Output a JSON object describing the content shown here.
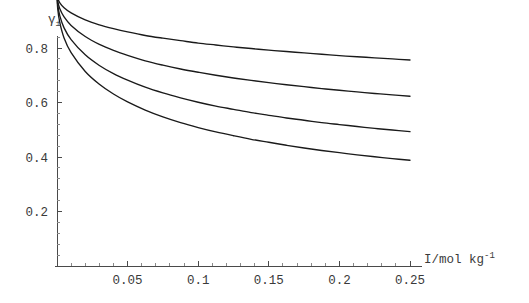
{
  "chart_data": {
    "type": "line",
    "title": "",
    "subtitle": "",
    "xlabel": "I/mol kg⁻¹",
    "ylabel": "γ±",
    "xlabel_parts": {
      "base": "I/mol kg",
      "exponent": "-1"
    },
    "ylabel_parts": {
      "base": "γ",
      "subscript": "±"
    },
    "xlim": [
      0,
      0.26
    ],
    "ylim": [
      0,
      1.06
    ],
    "grid": false,
    "legend": "none",
    "xticks": [
      0.05,
      0.1,
      0.15,
      0.2,
      0.25
    ],
    "xtick_labels": [
      "0.05",
      "0.1",
      "0.15",
      "0.2",
      "0.25"
    ],
    "yticks": [
      0.2,
      0.4,
      0.6,
      0.8,
      1
    ],
    "ytick_labels": [
      "0.2",
      "0.4",
      "0.6",
      "0.8",
      "1"
    ],
    "x_minor_step": 0.01,
    "y_minor_step": 0.04,
    "x": [
      0.0005,
      0.002,
      0.005,
      0.01,
      0.02,
      0.03,
      0.04,
      0.05,
      0.0625,
      0.075,
      0.0875,
      0.1,
      0.1125,
      0.125,
      0.1375,
      0.15,
      0.1625,
      0.175,
      0.1875,
      0.2,
      0.2125,
      0.225,
      0.2375,
      0.25
    ],
    "series": [
      {
        "name": "curve-1",
        "values": [
          0.983,
          0.966,
          0.948,
          0.929,
          0.903,
          0.885,
          0.871,
          0.859,
          0.846,
          0.836,
          0.827,
          0.818,
          0.811,
          0.804,
          0.798,
          0.792,
          0.787,
          0.782,
          0.777,
          0.772,
          0.768,
          0.764,
          0.76,
          0.756
        ]
      },
      {
        "name": "curve-2",
        "values": [
          0.972,
          0.944,
          0.914,
          0.883,
          0.842,
          0.813,
          0.791,
          0.773,
          0.753,
          0.737,
          0.723,
          0.711,
          0.7,
          0.69,
          0.681,
          0.673,
          0.665,
          0.658,
          0.651,
          0.645,
          0.639,
          0.633,
          0.628,
          0.623
        ]
      },
      {
        "name": "curve-3",
        "values": [
          0.958,
          0.918,
          0.874,
          0.831,
          0.775,
          0.736,
          0.706,
          0.682,
          0.656,
          0.635,
          0.617,
          0.601,
          0.587,
          0.575,
          0.563,
          0.553,
          0.543,
          0.535,
          0.526,
          0.519,
          0.512,
          0.505,
          0.499,
          0.493
        ]
      },
      {
        "name": "curve-4",
        "values": [
          0.944,
          0.893,
          0.837,
          0.783,
          0.714,
          0.667,
          0.631,
          0.602,
          0.572,
          0.547,
          0.526,
          0.508,
          0.492,
          0.478,
          0.465,
          0.454,
          0.443,
          0.433,
          0.424,
          0.416,
          0.408,
          0.401,
          0.394,
          0.388
        ]
      }
    ]
  },
  "geometry": {
    "origin_x": 57,
    "origin_y": 266,
    "plot_right": 414,
    "plot_top": 36,
    "x_per_unit": 1412,
    "y_per_unit": 272.5
  },
  "colors": {
    "curve": "#1a1a1a",
    "axis": "#4a4a4a",
    "text": "#3a3a3a",
    "background": "#ffffff"
  }
}
